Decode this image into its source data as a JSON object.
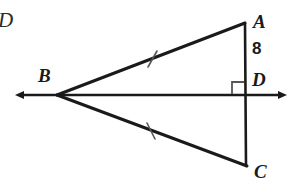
{
  "figure": {
    "background_color": "#ffffff",
    "stroke_color": "#1a1a1a"
  },
  "labels": {
    "corner_d": "D",
    "vertex_a": "A",
    "vertex_b": "B",
    "vertex_c": "C",
    "point_d": "D",
    "segment_ad_length": "8"
  },
  "geometry": {
    "points": {
      "A": {
        "x": 245,
        "y": 23
      },
      "B": {
        "x": 57,
        "y": 95
      },
      "C": {
        "x": 247,
        "y": 166
      },
      "D": {
        "x": 245,
        "y": 95
      }
    },
    "ray_left_end": {
      "x": 16,
      "y": 95
    },
    "ray_right_end": {
      "x": 286,
      "y": 95
    },
    "right_angle_marker": {
      "x": 232,
      "y": 82,
      "size": 13
    },
    "tick_marks": [
      {
        "on": "BA",
        "x": 152,
        "y": 59
      },
      {
        "on": "BC",
        "x": 151,
        "y": 131
      }
    ]
  }
}
